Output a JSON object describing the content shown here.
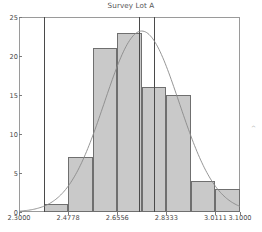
{
  "chart_data": {
    "type": "bar",
    "title": "Survey Lot A",
    "xlabel": "",
    "ylabel": "",
    "grid": false,
    "legend": "none",
    "xlim": [
      2.3,
      3.1
    ],
    "ylim": [
      0,
      25
    ],
    "yticks": [
      0,
      5,
      10,
      15,
      20,
      25
    ],
    "ytick_labels": [
      "0",
      "5",
      "10",
      "15",
      "20",
      "25"
    ],
    "xticks": [
      2.3,
      2.4778,
      2.6556,
      2.8333,
      3.0111,
      3.1
    ],
    "xtick_labels": [
      "2.3000",
      "2.4778",
      "2.6556",
      "2.8333",
      "3.0111",
      "3.1000"
    ],
    "bin_edges": [
      2.3889,
      2.4778,
      2.5667,
      2.6556,
      2.7444,
      2.8333,
      2.9222,
      3.0111,
      3.1
    ],
    "categories": [
      "2.3889-2.4778",
      "2.4778-2.5667",
      "2.5667-2.6556",
      "2.6556-2.7444",
      "2.7444-2.8333",
      "2.8333-2.9222",
      "2.9222-3.0111",
      "3.0111-3.1000"
    ],
    "values": [
      1,
      7,
      21,
      23,
      16,
      15,
      4,
      3
    ],
    "overlay_curve": {
      "name": "normal-fit",
      "type": "line",
      "mean": 2.7444,
      "peak_value": 23.2
    },
    "reference_lines": [
      {
        "name": "spec-limit-left",
        "x": 2.3889
      },
      {
        "name": "spec-limit-target",
        "x": 2.7333
      },
      {
        "name": "spec-limit-right",
        "x": 2.7889
      }
    ],
    "colors": {
      "bar_fill": "#c9c9c9",
      "bar_edge": "#6f6f6f",
      "curve": "#8a8a8a",
      "axis": "#9a9a9a",
      "reference_line": "#4a4a4a",
      "text": "#4a4a4a"
    }
  },
  "annotations": {
    "stray_glyph": "^"
  }
}
